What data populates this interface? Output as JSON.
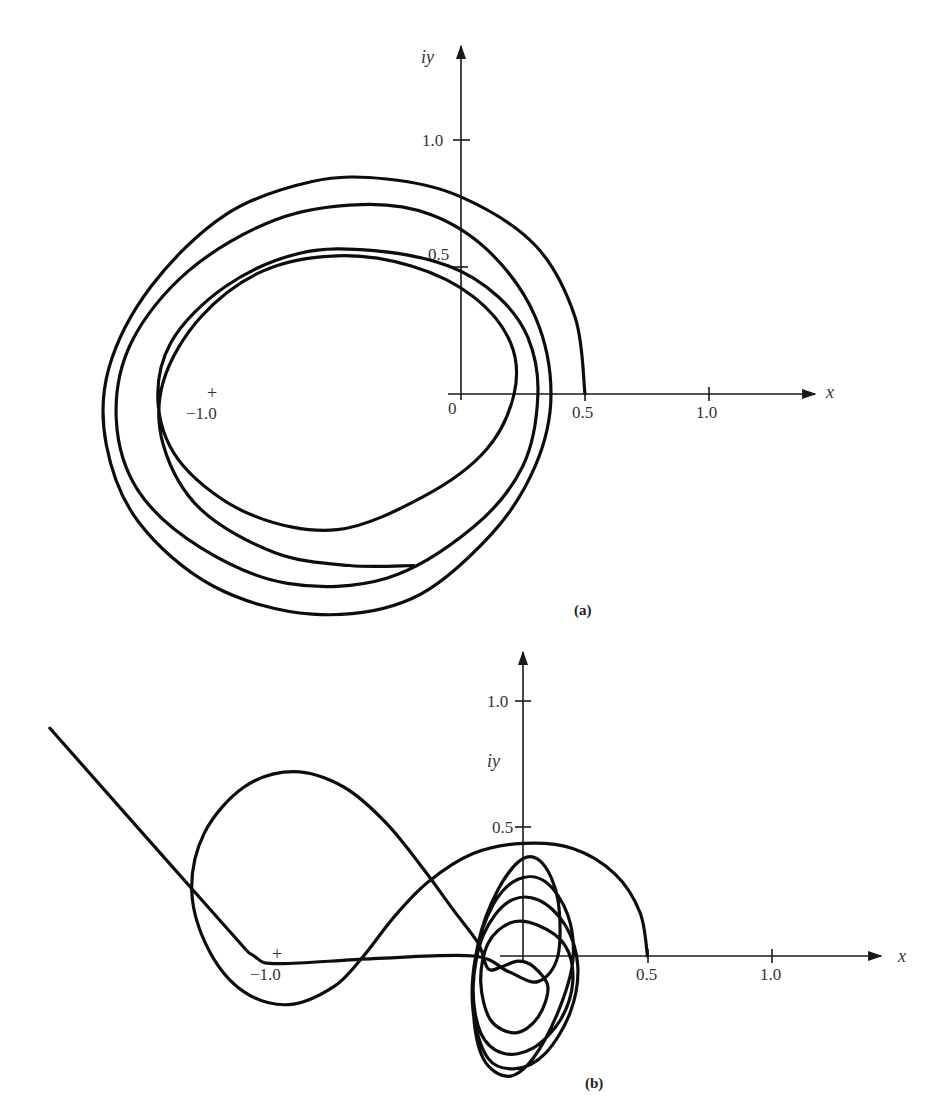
{
  "chart_data": [
    {
      "id": "a",
      "type": "line",
      "caption": "(a)",
      "title": "",
      "xlabel": "x",
      "ylabel": "iy",
      "origin_label": "0",
      "xticks": [
        0.5,
        1.0
      ],
      "xtick_labels": [
        "0.5",
        "1.0"
      ],
      "yticks": [
        0.5,
        1.0
      ],
      "ytick_labels": [
        "0.5",
        "1.0"
      ],
      "marker": {
        "x": -1.0,
        "y": 0,
        "symbol": "+",
        "label": "−1.0"
      },
      "xlim": [
        -1.5,
        1.45
      ],
      "ylim": [
        -0.9,
        1.35
      ],
      "grid": false,
      "series": [
        {
          "name": "trajectory",
          "points": [
            [
              0.5,
              0.0
            ],
            [
              0.46,
              0.3
            ],
            [
              0.3,
              0.58
            ],
            [
              0.0,
              0.77
            ],
            [
              -0.3,
              0.84
            ],
            [
              -0.6,
              0.83
            ],
            [
              -0.95,
              0.7
            ],
            [
              -1.25,
              0.42
            ],
            [
              -1.42,
              0.1
            ],
            [
              -1.43,
              -0.2
            ],
            [
              -1.3,
              -0.5
            ],
            [
              -1.0,
              -0.75
            ],
            [
              -0.6,
              -0.86
            ],
            [
              -0.2,
              -0.8
            ],
            [
              0.12,
              -0.55
            ],
            [
              0.3,
              -0.28
            ],
            [
              0.363,
              0.0
            ],
            [
              0.3,
              0.3
            ],
            [
              0.12,
              0.55
            ],
            [
              -0.12,
              0.7
            ],
            [
              -0.4,
              0.74
            ],
            [
              -0.75,
              0.68
            ],
            [
              -1.1,
              0.48
            ],
            [
              -1.33,
              0.2
            ],
            [
              -1.39,
              -0.1
            ],
            [
              -1.3,
              -0.38
            ],
            [
              -1.05,
              -0.6
            ],
            [
              -0.7,
              -0.74
            ],
            [
              -0.3,
              -0.72
            ],
            [
              0.05,
              -0.52
            ],
            [
              0.25,
              -0.28
            ],
            [
              0.31,
              0.0
            ],
            [
              0.27,
              0.22
            ],
            [
              0.15,
              0.38
            ],
            [
              -0.05,
              0.5
            ],
            [
              -0.35,
              0.56
            ],
            [
              -0.65,
              0.55
            ],
            [
              -0.95,
              0.42
            ],
            [
              -1.17,
              0.2
            ],
            [
              -1.22,
              -0.05
            ],
            [
              -1.12,
              -0.28
            ],
            [
              -0.85,
              -0.47
            ],
            [
              -0.5,
              -0.53
            ],
            [
              -0.15,
              -0.4
            ],
            [
              0.1,
              -0.22
            ],
            [
              0.214,
              0.0
            ],
            [
              0.2,
              0.2
            ],
            [
              0.05,
              0.38
            ],
            [
              -0.2,
              0.5
            ],
            [
              -0.5,
              0.54
            ],
            [
              -0.8,
              0.48
            ],
            [
              -1.05,
              0.3
            ],
            [
              -1.2,
              0.05
            ],
            [
              -1.2,
              -0.2
            ],
            [
              -1.05,
              -0.45
            ],
            [
              -0.75,
              -0.62
            ],
            [
              -0.45,
              -0.67
            ],
            [
              -0.19,
              -0.67
            ]
          ]
        }
      ]
    },
    {
      "id": "b",
      "type": "line",
      "caption": "(b)",
      "title": "",
      "xlabel": "x",
      "ylabel": "iy",
      "xticks": [
        0.5,
        1.0
      ],
      "xtick_labels": [
        "0.5",
        "1.0"
      ],
      "yticks": [
        0.5,
        1.0
      ],
      "ytick_labels": [
        "0.5",
        "1.0"
      ],
      "marker": {
        "x": -1.0,
        "y": 0,
        "symbol": "+",
        "label": "−1.0"
      },
      "xlim": [
        -1.95,
        1.45
      ],
      "ylim": [
        -0.4,
        1.2
      ],
      "grid": false,
      "series": [
        {
          "name": "trajectory",
          "points": [
            [
              0.5,
              0.0
            ],
            [
              0.47,
              0.17
            ],
            [
              0.37,
              0.32
            ],
            [
              0.2,
              0.42
            ],
            [
              0.0,
              0.44
            ],
            [
              -0.2,
              0.4
            ],
            [
              -0.38,
              0.29
            ],
            [
              -0.52,
              0.15
            ],
            [
              -0.64,
              0.0
            ],
            [
              -0.76,
              -0.12
            ],
            [
              -0.94,
              -0.19
            ],
            [
              -1.12,
              -0.14
            ],
            [
              -1.26,
              0.02
            ],
            [
              -1.33,
              0.25
            ],
            [
              -1.28,
              0.48
            ],
            [
              -1.12,
              0.66
            ],
            [
              -0.92,
              0.72
            ],
            [
              -0.72,
              0.66
            ],
            [
              -0.55,
              0.52
            ],
            [
              -0.4,
              0.34
            ],
            [
              -0.28,
              0.18
            ],
            [
              -0.18,
              0.05
            ],
            [
              -0.14,
              -0.05
            ],
            [
              -0.08,
              -0.04
            ],
            [
              -0.02,
              -0.02
            ],
            [
              0.04,
              -0.04
            ],
            [
              0.1,
              -0.12
            ],
            [
              0.06,
              -0.24
            ],
            [
              -0.03,
              -0.3
            ],
            [
              -0.13,
              -0.25
            ],
            [
              -0.17,
              -0.1
            ],
            [
              -0.14,
              0.05
            ],
            [
              -0.05,
              0.13
            ],
            [
              0.06,
              0.12
            ],
            [
              0.17,
              0.04
            ],
            [
              0.2,
              -0.1
            ],
            [
              0.15,
              -0.25
            ],
            [
              0.04,
              -0.36
            ],
            [
              -0.08,
              -0.38
            ],
            [
              -0.17,
              -0.3
            ],
            [
              -0.2,
              -0.12
            ],
            [
              -0.16,
              0.08
            ],
            [
              -0.06,
              0.21
            ],
            [
              0.06,
              0.22
            ],
            [
              0.17,
              0.12
            ],
            [
              0.22,
              -0.04
            ],
            [
              0.19,
              -0.22
            ],
            [
              0.09,
              -0.38
            ],
            [
              -0.03,
              -0.44
            ],
            [
              -0.14,
              -0.4
            ],
            [
              -0.2,
              -0.22
            ],
            [
              -0.19,
              0.0
            ],
            [
              -0.12,
              0.2
            ],
            [
              -0.02,
              0.3
            ],
            [
              0.09,
              0.29
            ],
            [
              0.18,
              0.16
            ],
            [
              0.2,
              -0.02
            ],
            [
              0.14,
              -0.22
            ],
            [
              0.04,
              -0.4
            ],
            [
              -0.06,
              -0.47
            ],
            [
              -0.16,
              -0.4
            ],
            [
              -0.2,
              -0.2
            ],
            [
              -0.18,
              0.05
            ],
            [
              -0.1,
              0.26
            ],
            [
              0.0,
              0.38
            ],
            [
              0.08,
              0.36
            ],
            [
              0.14,
              0.22
            ],
            [
              0.14,
              0.0
            ],
            [
              0.06,
              -0.1
            ],
            [
              -0.06,
              -0.06
            ],
            [
              -0.2,
              0.0
            ],
            [
              -0.6,
              -0.01
            ],
            [
              -0.98,
              -0.03
            ],
            [
              -1.08,
              0.0
            ],
            [
              -1.2,
              0.12
            ],
            [
              -1.9,
              0.89
            ]
          ]
        }
      ]
    }
  ],
  "labels": {
    "a": {
      "ylabel": "iy",
      "xlabel": "x",
      "origin": "0",
      "xt1": "0.5",
      "xt2": "1.0",
      "yt1": "0.5",
      "yt2": "1.0",
      "minus_one": "−1.0",
      "plus": "+",
      "caption": "(a)"
    },
    "b": {
      "ylabel": "iy",
      "xlabel": "x",
      "xt1": "0.5",
      "xt2": "1.0",
      "yt1": "0.5",
      "yt2": "1.0",
      "minus_one": "−1.0",
      "plus": "+",
      "caption": "(b)"
    }
  }
}
